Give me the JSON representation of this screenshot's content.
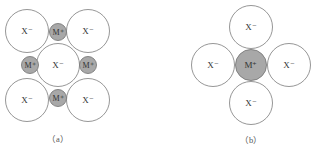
{
  "colors": {
    "anion_fill": "#ffffff",
    "cation_fill": "#a8a8a8",
    "outline": "#8a8a8a"
  },
  "panel_a": {
    "caption": "（a）",
    "anions": [
      {
        "label": "X⁻"
      },
      {
        "label": "X⁻"
      },
      {
        "label": "X⁻"
      },
      {
        "label": "X⁻"
      },
      {
        "label": "X⁻"
      }
    ],
    "cations": [
      {
        "label": "M⁺"
      },
      {
        "label": "M⁺"
      },
      {
        "label": "M⁺"
      },
      {
        "label": "M⁺"
      }
    ]
  },
  "panel_b": {
    "caption": "（b）",
    "anions": [
      {
        "label": "X⁻"
      },
      {
        "label": "X⁻"
      },
      {
        "label": "X⁻"
      },
      {
        "label": "X⁻"
      }
    ],
    "cation": {
      "label": "M⁺"
    }
  }
}
